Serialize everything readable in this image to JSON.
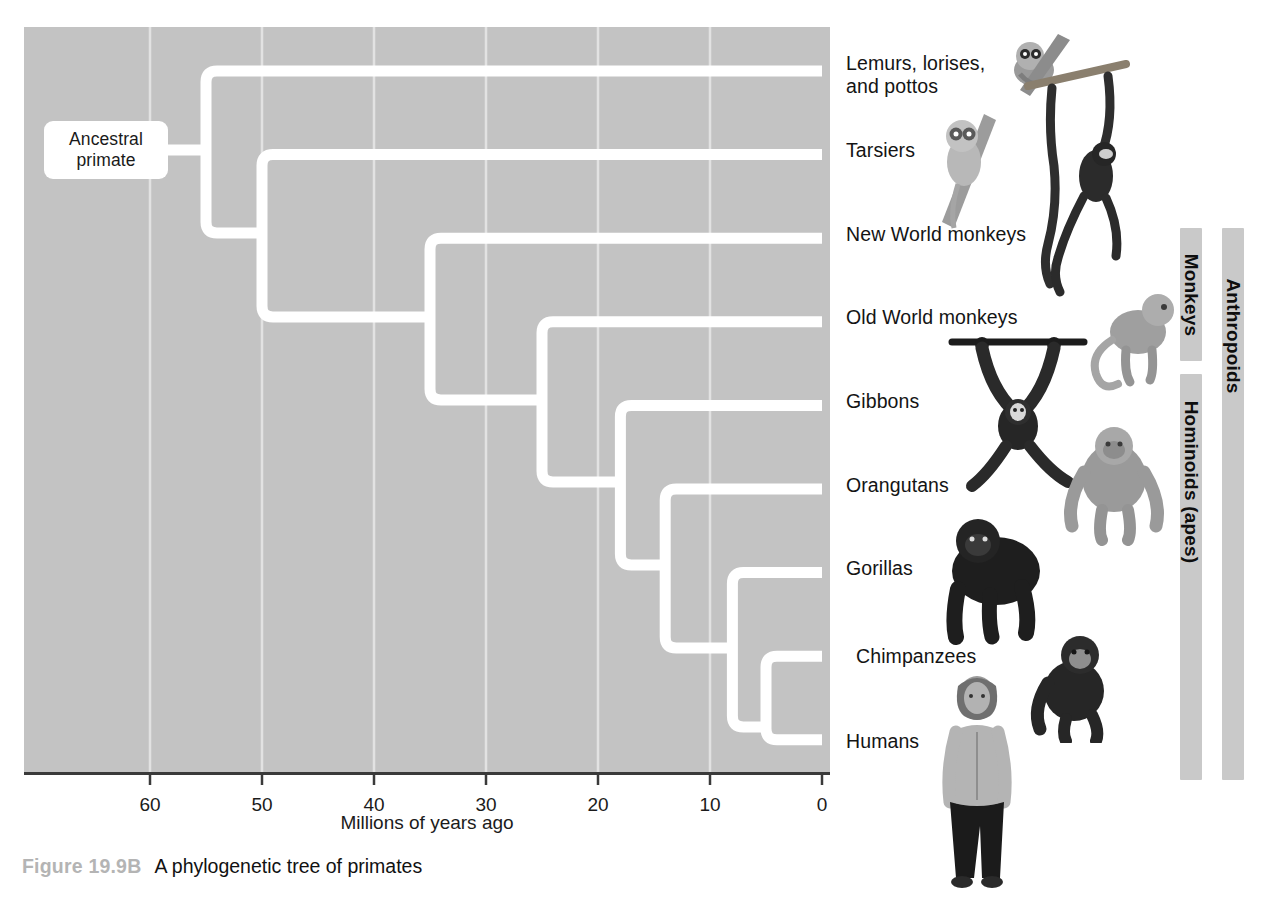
{
  "figure": {
    "caption_number": "Figure 19.9B",
    "caption_text": "A phylogenetic tree of primates",
    "root_label": "Ancestral\nprimate",
    "panel_color": "#c3c3c3",
    "branch_color": "#ffffff",
    "group_bar_color": "#c9c9c9"
  },
  "axis": {
    "title": "Millions of years ago",
    "ticks": [
      60,
      50,
      40,
      30,
      20,
      10,
      0
    ],
    "tick_labels": [
      "60",
      "50",
      "40",
      "30",
      "20",
      "10",
      "0"
    ],
    "min": 0,
    "max": 71.5,
    "reversed": true
  },
  "chart_data": {
    "type": "tree",
    "title": "A phylogenetic tree of primates",
    "xlabel": "Millions of years ago",
    "ylabel": "",
    "xlim": [
      71.5,
      0
    ],
    "grid": true,
    "units": "millions of years ago",
    "root_age": 55,
    "taxa": [
      {
        "name": "Lemurs, lorises,\nand pottos",
        "row": 0,
        "age": 0
      },
      {
        "name": "Tarsiers",
        "row": 1,
        "age": 0
      },
      {
        "name": "New World monkeys",
        "row": 2,
        "age": 0
      },
      {
        "name": "Old World monkeys",
        "row": 3,
        "age": 0
      },
      {
        "name": "Gibbons",
        "row": 4,
        "age": 0
      },
      {
        "name": "Orangutans",
        "row": 5,
        "age": 0
      },
      {
        "name": "Gorillas",
        "row": 6,
        "age": 0
      },
      {
        "name": "Chimpanzees",
        "row": 7,
        "age": 0
      },
      {
        "name": "Humans",
        "row": 8,
        "age": 0
      }
    ],
    "nodes": [
      {
        "id": "n1",
        "age": 55,
        "children_rows": [
          0,
          8
        ],
        "label": "Ancestral primate"
      },
      {
        "id": "n2",
        "age": 50,
        "children_rows": [
          1,
          8
        ],
        "label": ""
      },
      {
        "id": "n3",
        "age": 35,
        "children_rows": [
          2,
          8
        ],
        "label": ""
      },
      {
        "id": "n4",
        "age": 25,
        "children_rows": [
          3,
          8
        ],
        "label": ""
      },
      {
        "id": "n5",
        "age": 18,
        "children_rows": [
          4,
          8
        ],
        "label": ""
      },
      {
        "id": "n6",
        "age": 14,
        "children_rows": [
          5,
          8
        ],
        "label": ""
      },
      {
        "id": "n7",
        "age": 8,
        "children_rows": [
          6,
          8
        ],
        "label": ""
      },
      {
        "id": "n8",
        "age": 5,
        "children_rows": [
          7,
          8
        ],
        "label": ""
      }
    ]
  },
  "groups": [
    {
      "name": "Monkeys",
      "first_row": 2,
      "last_row": 3,
      "column": 0
    },
    {
      "name": "Hominoids (apes)",
      "first_row": 4,
      "last_row": 8,
      "column": 0
    },
    {
      "name": "Anthropoids",
      "first_row": 2,
      "last_row": 8,
      "column": 1
    }
  ],
  "illustrations": [
    {
      "name": "loris-illustration",
      "taxon": "Lemurs, lorises, and pottos"
    },
    {
      "name": "tarsier-illustration",
      "taxon": "Tarsiers"
    },
    {
      "name": "spider-monkey-illustration",
      "taxon": "New World monkeys"
    },
    {
      "name": "macaque-illustration",
      "taxon": "Old World monkeys"
    },
    {
      "name": "gibbon-illustration",
      "taxon": "Gibbons"
    },
    {
      "name": "orangutan-illustration",
      "taxon": "Orangutans"
    },
    {
      "name": "gorilla-illustration",
      "taxon": "Gorillas"
    },
    {
      "name": "chimpanzee-illustration",
      "taxon": "Chimpanzees"
    },
    {
      "name": "human-illustration",
      "taxon": "Humans"
    }
  ]
}
